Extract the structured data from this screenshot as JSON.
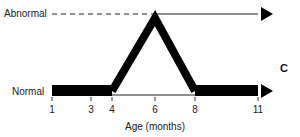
{
  "labels": {
    "abnormal": "Abnormal",
    "normal": "Normal",
    "xlabel": "Age (months)",
    "panel": "C"
  },
  "chart_data": {
    "type": "line",
    "title": "",
    "xlabel": "Age (months)",
    "ylabel": "",
    "y_categories": [
      "Normal",
      "Abnormal"
    ],
    "x_ticks": [
      1,
      3,
      4,
      6,
      8,
      11
    ],
    "x_tick_labels": [
      "1",
      "3",
      "4",
      "6",
      "8",
      "11"
    ],
    "xlim": [
      1,
      11
    ],
    "series": [
      {
        "name": "state",
        "points": [
          {
            "x": 1,
            "y": "Normal"
          },
          {
            "x": 4,
            "y": "Normal"
          },
          {
            "x": 6,
            "y": "Abnormal"
          },
          {
            "x": 8,
            "y": "Normal"
          },
          {
            "x": 11,
            "y": "Normal"
          }
        ]
      }
    ],
    "annotations": [
      {
        "type": "dashed-line",
        "from_x": 1,
        "to_x": 6,
        "level": "Abnormal"
      },
      {
        "type": "thin-line",
        "from_x": 6,
        "to_x": 11,
        "level": "Abnormal",
        "arrow": "right"
      },
      {
        "type": "thin-line",
        "from_x": 4,
        "to_x": 8,
        "level": "Normal"
      },
      {
        "type": "thick-bar",
        "from_x": 1,
        "to_x": 4,
        "level": "Normal"
      },
      {
        "type": "thick-bar",
        "from_x": 8,
        "to_x": 11,
        "level": "Normal",
        "arrow": "right"
      }
    ]
  }
}
